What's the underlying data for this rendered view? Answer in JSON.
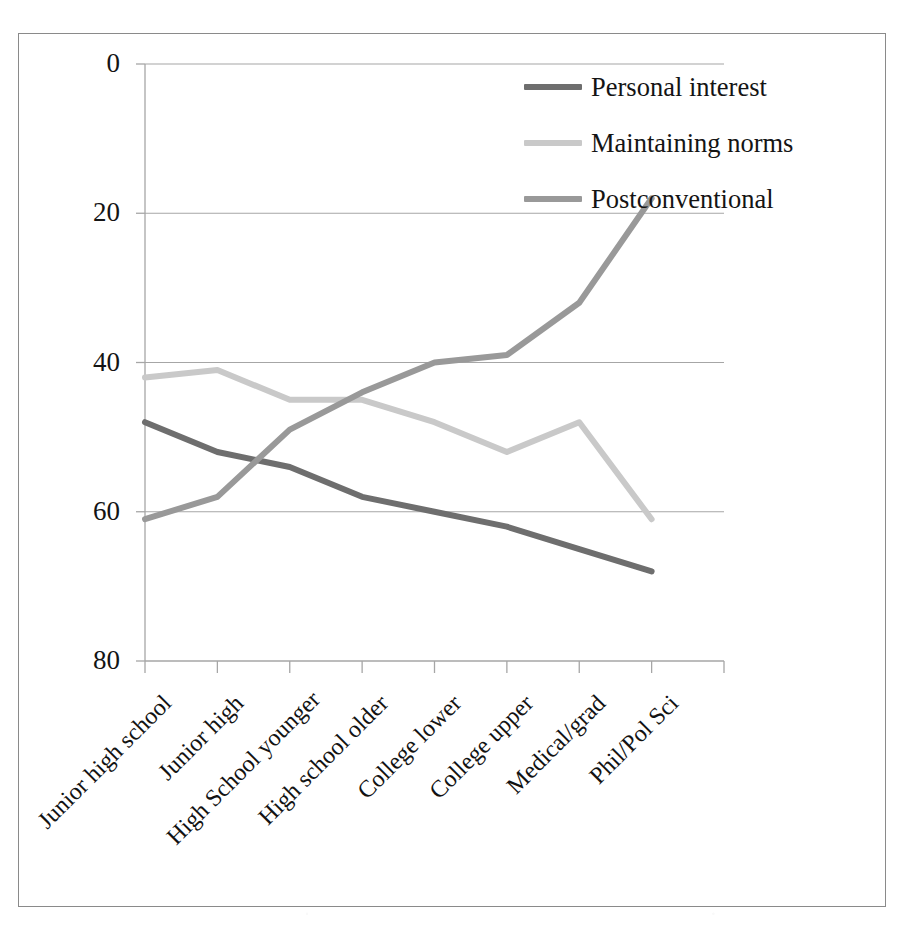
{
  "figure": {
    "border_color": "#8a8a8a",
    "background": "#ffffff"
  },
  "axis": {
    "y_ticks": [
      "80",
      "60",
      "40",
      "20",
      "0"
    ],
    "x_tick_count": 9
  },
  "legend": {
    "items": [
      {
        "label": "Personal interest",
        "color": "#6e6e6e"
      },
      {
        "label": "Maintaining norms",
        "color": "#c9c9c9"
      },
      {
        "label": "Postconventional",
        "color": "#999999"
      }
    ]
  },
  "chart_data": {
    "type": "line",
    "title": "",
    "xlabel": "",
    "ylabel": "",
    "ylim": [
      0,
      80
    ],
    "yticks": [
      0,
      20,
      40,
      60,
      80
    ],
    "grid": "horizontal",
    "legend_position": "top-right",
    "categories": [
      "Junior high school",
      "Junior high",
      "High School younger",
      "High school older",
      "College lower",
      "College upper",
      "Medical/grad",
      "Phil/Pol Sci"
    ],
    "series": [
      {
        "name": "Personal interest",
        "color": "#6e6e6e",
        "values": [
          32,
          28,
          26,
          22,
          20,
          18,
          15,
          12
        ]
      },
      {
        "name": "Maintaining norms",
        "color": "#c9c9c9",
        "values": [
          38,
          39,
          35,
          35,
          32,
          28,
          32,
          19
        ]
      },
      {
        "name": "Postconventional",
        "color": "#999999",
        "values": [
          19,
          22,
          31,
          36,
          40,
          41,
          48,
          62
        ]
      }
    ]
  }
}
